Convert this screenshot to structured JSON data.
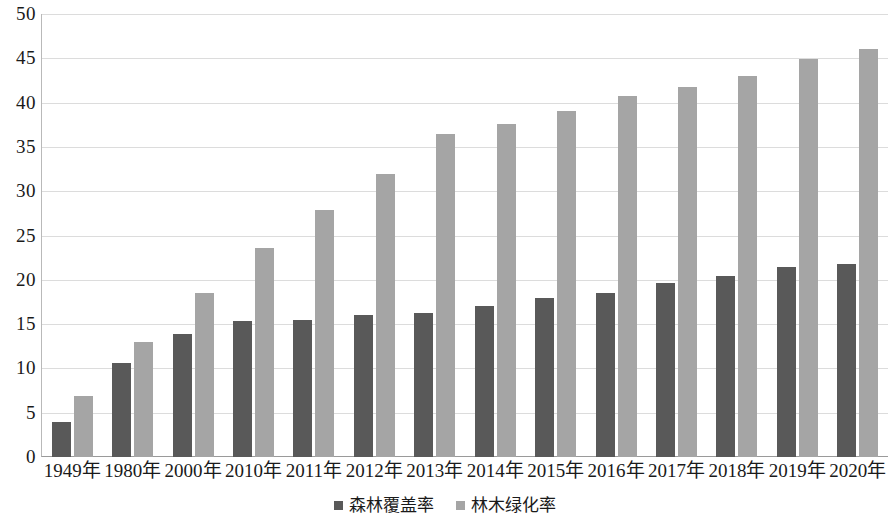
{
  "chart_data": {
    "type": "bar",
    "title": "",
    "subtitle": "",
    "xlabel": "",
    "ylabel": "",
    "ylim": [
      0,
      50
    ],
    "ytick_step": 5,
    "yticks": [
      "50",
      "45",
      "40",
      "35",
      "30",
      "25",
      "20",
      "15",
      "10",
      "5",
      "0"
    ],
    "ytick_values": [
      50,
      45,
      40,
      35,
      30,
      25,
      20,
      15,
      10,
      5,
      0
    ],
    "grid": "horizontal",
    "legend_position": "bottom-center",
    "categories": [
      "1949年",
      "1980年",
      "2000年",
      "2010年",
      "2011年",
      "2012年",
      "2013年",
      "2014年",
      "2015年",
      "2016年",
      "2017年",
      "2018年",
      "2019年",
      "2020年"
    ],
    "series": [
      {
        "name": "森林覆盖率",
        "color": "#595959",
        "values": [
          4.0,
          10.6,
          13.9,
          15.4,
          15.5,
          16.0,
          16.2,
          17.0,
          17.9,
          18.5,
          19.6,
          20.4,
          21.4,
          21.8
        ]
      },
      {
        "name": "林木绿化率",
        "color": "#a5a5a5",
        "values": [
          6.9,
          13.0,
          18.5,
          23.6,
          27.9,
          31.9,
          36.5,
          37.6,
          39.0,
          40.7,
          41.8,
          43.0,
          44.9,
          46.0
        ]
      }
    ]
  },
  "colors": {
    "series_1": "#595959",
    "series_2": "#a5a5a5",
    "gridline": "#dcdcdc",
    "axis": "#9a9a9a",
    "text": "#1a1a1a",
    "background": "#ffffff"
  }
}
